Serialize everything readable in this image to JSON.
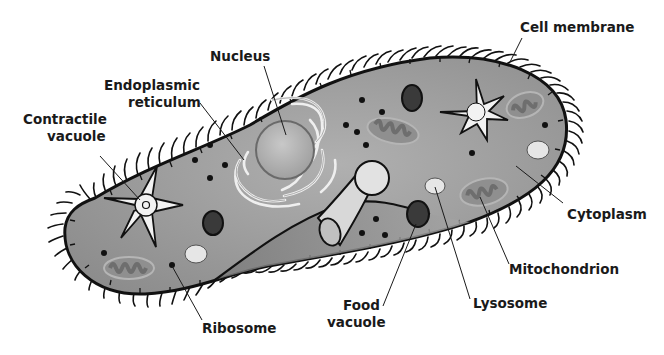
{
  "diagram": {
    "colors": {
      "cytoplasm": "#9a9a9a",
      "membrane": "#111111",
      "organelle_light": "#e8e8e8",
      "mitochondrion_fill": "#8a8a8a",
      "mitochondrion_inner": "#6e6e6e",
      "food_vacuole": "#3a3a3a",
      "label_text": "#1a1a1a"
    },
    "labels": {
      "cell_membrane": "Cell membrane",
      "nucleus": "Nucleus",
      "er_line1": "Endoplasmic",
      "er_line2": "reticulum",
      "cv_line1": "Contractile",
      "cv_line2": "vacuole",
      "cytoplasm": "Cytoplasm",
      "mitochondrion": "Mitochondrion",
      "lysosome": "Lysosome",
      "fv_line1": "Food",
      "fv_line2": "vacuole",
      "ribosome": "Ribosome"
    }
  }
}
